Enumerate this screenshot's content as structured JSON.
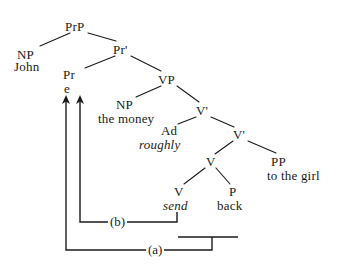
{
  "diagram": {
    "kind": "syntax-tree",
    "title": "",
    "ink_color": "#1a1a1a",
    "background_color": "#ffffff",
    "nodes": [
      {
        "id": "PrP",
        "label": "PrP",
        "x": 78,
        "y": 26
      },
      {
        "id": "NP1",
        "label": "NP",
        "x": 28,
        "y": 54
      },
      {
        "id": "PrBar",
        "label": "Pr'",
        "x": 122,
        "y": 49
      },
      {
        "id": "Pr",
        "label": "Pr",
        "x": 71,
        "y": 74
      },
      {
        "id": "VP",
        "label": "VP",
        "x": 168,
        "y": 79
      },
      {
        "id": "NP2",
        "label": "NP",
        "x": 126,
        "y": 104
      },
      {
        "id": "VBar1",
        "label": "V'",
        "x": 203,
        "y": 110
      },
      {
        "id": "Ad",
        "label": "Ad",
        "x": 170,
        "y": 130
      },
      {
        "id": "VBar2",
        "label": "V'",
        "x": 240,
        "y": 134
      },
      {
        "id": "V1",
        "label": "V",
        "x": 211,
        "y": 161
      },
      {
        "id": "PP",
        "label": "PP",
        "x": 280,
        "y": 161
      },
      {
        "id": "V2",
        "label": "V",
        "x": 178,
        "y": 191
      },
      {
        "id": "P",
        "label": "P",
        "x": 233,
        "y": 191
      }
    ],
    "terminals": [
      {
        "id": "john",
        "text": "John",
        "x": 30,
        "y": 66,
        "italic": false
      },
      {
        "id": "e",
        "text": "e",
        "x": 68,
        "y": 88,
        "italic": false
      },
      {
        "id": "money",
        "text": "the money",
        "x": 130,
        "y": 118,
        "italic": false
      },
      {
        "id": "roughly",
        "text": "roughly",
        "x": 161,
        "y": 144,
        "italic": true
      },
      {
        "id": "girl",
        "text": "to the girl",
        "x": 309,
        "y": 175,
        "italic": false
      },
      {
        "id": "send",
        "text": "send",
        "x": 180,
        "y": 205,
        "italic": true
      },
      {
        "id": "back",
        "text": "back",
        "x": 234,
        "y": 205,
        "italic": false
      }
    ],
    "branches": [
      {
        "from": "PrP",
        "to": "NP1",
        "x1": 70,
        "y1": 33,
        "x2": 40,
        "y2": 46
      },
      {
        "from": "PrP",
        "to": "PrBar",
        "x1": 88,
        "y1": 33,
        "x2": 116,
        "y2": 41
      },
      {
        "from": "PrBar",
        "to": "Pr",
        "x1": 115,
        "y1": 56,
        "x2": 85,
        "y2": 68
      },
      {
        "from": "PrBar",
        "to": "VP",
        "x1": 131,
        "y1": 56,
        "x2": 161,
        "y2": 71
      },
      {
        "from": "VP",
        "to": "NP2",
        "x1": 161,
        "y1": 86,
        "x2": 136,
        "y2": 97
      },
      {
        "from": "VP",
        "to": "VBar1",
        "x1": 177,
        "y1": 86,
        "x2": 199,
        "y2": 102
      },
      {
        "from": "VBar1",
        "to": "Ad",
        "x1": 196,
        "y1": 117,
        "x2": 178,
        "y2": 124
      },
      {
        "from": "VBar1",
        "to": "VBar2",
        "x1": 211,
        "y1": 117,
        "x2": 234,
        "y2": 127
      },
      {
        "from": "VBar2",
        "to": "V1",
        "x1": 233,
        "y1": 141,
        "x2": 215,
        "y2": 154
      },
      {
        "from": "VBar2",
        "to": "PP",
        "x1": 248,
        "y1": 141,
        "x2": 276,
        "y2": 153
      },
      {
        "from": "V1",
        "to": "V2",
        "x1": 205,
        "y1": 168,
        "x2": 184,
        "y2": 184
      },
      {
        "from": "V1",
        "to": "P",
        "x1": 216,
        "y1": 168,
        "x2": 230,
        "y2": 184
      }
    ],
    "movements": [
      {
        "id": "b",
        "label": "(b)",
        "label_x": 120,
        "label_y": 222,
        "description": "V send raises to Pr",
        "path": "M 177 213 L 177 222 L 80 222 L 80 100",
        "arrow_x": 80,
        "arrow_y": 96
      },
      {
        "id": "a",
        "label": "(a)",
        "label_x": 158,
        "label_y": 250,
        "description": "particle back and V complex raise to Pr",
        "path": "M 178 238 L 238 238 M 212 238 L 212 250 L 66 250 L 66 100",
        "arrow_x": 66,
        "arrow_y": 96
      }
    ]
  }
}
